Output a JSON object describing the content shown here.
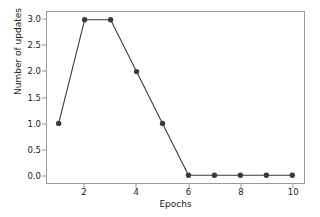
{
  "chart_data": {
    "type": "line",
    "title": "",
    "xlabel": "Epochs",
    "ylabel": "Number of updates",
    "x": [
      1,
      2,
      3,
      4,
      5,
      6,
      7,
      8,
      9,
      10
    ],
    "values": [
      1,
      3,
      3,
      2,
      1,
      0,
      0,
      0,
      0,
      0
    ],
    "series": [
      {
        "name": "Number of updates",
        "values": [
          1,
          3,
          3,
          2,
          1,
          0,
          0,
          0,
          0,
          0
        ]
      }
    ],
    "xlim": [
      0.55,
      10.45
    ],
    "ylim": [
      -0.15,
      3.15
    ],
    "xticks": [
      2,
      4,
      6,
      8,
      10
    ],
    "xtick_labels": [
      "2",
      "4",
      "6",
      "8",
      "10"
    ],
    "yticks": [
      0.0,
      0.5,
      1.0,
      1.5,
      2.0,
      2.5,
      3.0
    ],
    "ytick_labels": [
      "0.0",
      "0.5",
      "1.0",
      "1.5",
      "2.0",
      "2.5",
      "3.0"
    ],
    "grid": false,
    "legend": null,
    "legend_position": "none",
    "marker": "circle",
    "line_color": "#3a3a3a",
    "marker_color": "#3a3a3a",
    "background_color": "#ffffff",
    "axis_color": "#9a9a9a"
  }
}
